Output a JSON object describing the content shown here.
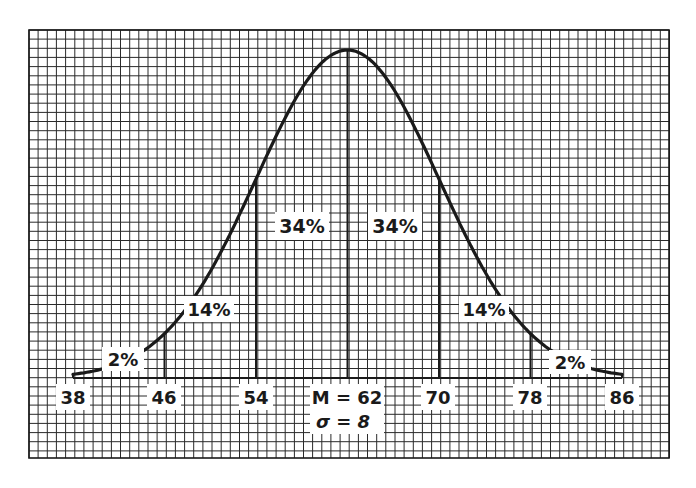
{
  "chart_data": {
    "type": "area",
    "title": "",
    "subtitle": "",
    "mean": 62,
    "sd": 8,
    "mean_label": "M = 62",
    "sd_label": "σ = 8",
    "xlabel": "",
    "ylabel": "",
    "x_ticks": [
      38,
      46,
      54,
      62,
      70,
      78,
      86
    ],
    "x_tick_labels": [
      "38",
      "46",
      "54",
      "M = 62",
      "70",
      "78",
      "86"
    ],
    "xlim": [
      38,
      86
    ],
    "grid": true,
    "legend": null,
    "segments": [
      {
        "from": 38,
        "to": 46,
        "percent": 2,
        "label": "2%"
      },
      {
        "from": 46,
        "to": 54,
        "percent": 14,
        "label": "14%"
      },
      {
        "from": 54,
        "to": 62,
        "percent": 34,
        "label": "34%"
      },
      {
        "from": 62,
        "to": 70,
        "percent": 34,
        "label": "34%"
      },
      {
        "from": 70,
        "to": 78,
        "percent": 14,
        "label": "14%"
      },
      {
        "from": 78,
        "to": 86,
        "percent": 2,
        "label": "2%"
      }
    ]
  },
  "labels": {
    "seg0": "2%",
    "seg1": "14%",
    "seg2": "34%",
    "seg3": "34%",
    "seg4": "14%",
    "seg5": "2%",
    "tick38": "38",
    "tick46": "46",
    "tick54": "54",
    "tick62": "M = 62",
    "tick70": "70",
    "tick78": "78",
    "tick86": "86",
    "sigma": "σ = 8"
  },
  "colors": {
    "ink": "#1a1a1a",
    "grid": "#2a2a2a",
    "paper": "#ffffff"
  }
}
